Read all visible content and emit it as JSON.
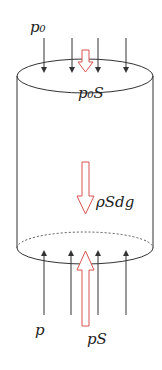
{
  "diagram": {
    "labels": {
      "top_pressure": "p₀",
      "top_force": "p₀S",
      "weight": "ρSdg",
      "bottom_pressure": "p",
      "bottom_force": "pS"
    },
    "colors": {
      "line": "#333333",
      "force_arrow": "#d9534f",
      "dashed": "#555555"
    }
  }
}
